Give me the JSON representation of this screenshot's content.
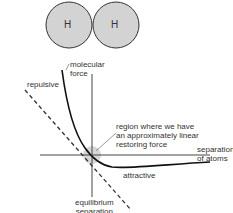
{
  "molecule": {
    "atoms": [
      {
        "label": "H"
      },
      {
        "label": "H"
      }
    ],
    "atom_fill": "#d3d3d3",
    "atom_stroke": "#333333"
  },
  "graph": {
    "y_axis_label": [
      "molecular",
      "force"
    ],
    "x_axis_label": [
      "separation",
      "of atoms"
    ],
    "equilibrium_label": [
      "equilibrium",
      "separation"
    ],
    "repulsive_label": "repulsive",
    "attractive_label": "attractive",
    "region_label": [
      "region where we have",
      "an approximately linear",
      "restoring force"
    ],
    "curve_color": "#111111",
    "axis_color": "#444444",
    "highlight_color": "#cccccc"
  }
}
